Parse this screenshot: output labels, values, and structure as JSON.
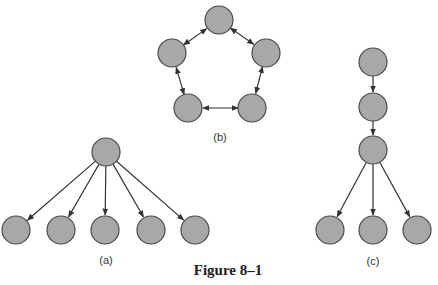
{
  "figure": {
    "caption": "Figure 8–1",
    "node_fill": "#a8a8a8",
    "node_stroke": "#4a4a4a",
    "edge_color": "#333333"
  },
  "panels": {
    "a": {
      "label": "(a)",
      "type": "star-tree",
      "nodes": [
        [
          106,
          152
        ],
        [
          16,
          230
        ],
        [
          61,
          230
        ],
        [
          105,
          230
        ],
        [
          151,
          230
        ],
        [
          195,
          230
        ]
      ],
      "edges": [
        [
          0,
          1
        ],
        [
          0,
          2
        ],
        [
          0,
          3
        ],
        [
          0,
          4
        ],
        [
          0,
          5
        ]
      ],
      "directed": true
    },
    "b": {
      "label": "(b)",
      "type": "ring",
      "nodes": [
        [
          219,
          20
        ],
        [
          266,
          53
        ],
        [
          252,
          108
        ],
        [
          188,
          108
        ],
        [
          172,
          53
        ]
      ],
      "edges": [
        [
          0,
          1
        ],
        [
          1,
          2
        ],
        [
          2,
          3
        ],
        [
          3,
          4
        ],
        [
          4,
          0
        ]
      ],
      "directed": "bidirectional"
    },
    "c": {
      "label": "(c)",
      "type": "chain-tree",
      "nodes": [
        [
          373,
          62
        ],
        [
          373,
          107
        ],
        [
          373,
          150
        ],
        [
          330,
          230
        ],
        [
          373,
          230
        ],
        [
          417,
          230
        ]
      ],
      "edges": [
        [
          0,
          1
        ],
        [
          1,
          2
        ],
        [
          2,
          3
        ],
        [
          2,
          4
        ],
        [
          2,
          5
        ]
      ],
      "directed": true
    }
  }
}
